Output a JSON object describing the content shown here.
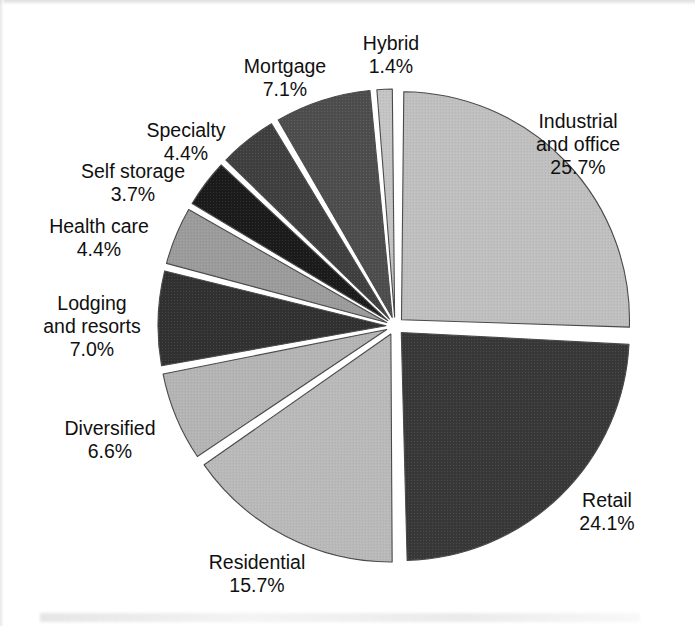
{
  "page": {
    "background_color": "#ffffff",
    "text_color": "#101010"
  },
  "chart_data": {
    "type": "pie",
    "title": "",
    "subtitle": "",
    "xlabel": "",
    "ylabel": "",
    "legend_position": "none",
    "exploded": true,
    "start_angle_deg": 0,
    "direction": "clockwise",
    "units": "percent",
    "total": 100.1,
    "categories": [
      "Industrial and office",
      "Retail",
      "Residential",
      "Diversified",
      "Lodging and resorts",
      "Health care",
      "Self storage",
      "Specialty",
      "Mortgage",
      "Hybrid"
    ],
    "values": [
      25.7,
      24.1,
      15.7,
      6.6,
      7.0,
      4.4,
      3.7,
      4.4,
      7.1,
      1.4
    ],
    "colors": [
      "#bfbfbf",
      "#383838",
      "#b9b9b9",
      "#b4b4b4",
      "#313131",
      "#9b9b9b",
      "#1b1b1b",
      "#3f3f3f",
      "#4d4d4d",
      "#c4c4c4"
    ],
    "slices": [
      {
        "label": "Industrial and office",
        "label_lines": [
          "Industrial",
          "and office"
        ],
        "percent_text": "25.7%",
        "value": 25.7,
        "color": "#bfbfbf",
        "label_x": 578,
        "label_y": 128
      },
      {
        "label": "Retail",
        "label_lines": [
          "Retail"
        ],
        "percent_text": "24.1%",
        "value": 24.1,
        "color": "#383838",
        "label_x": 607,
        "label_y": 507
      },
      {
        "label": "Residential",
        "label_lines": [
          "Residential"
        ],
        "percent_text": "15.7%",
        "value": 15.7,
        "color": "#b9b9b9",
        "label_x": 257,
        "label_y": 569
      },
      {
        "label": "Diversified",
        "label_lines": [
          "Diversified"
        ],
        "percent_text": "6.6%",
        "value": 6.6,
        "color": "#b4b4b4",
        "label_x": 110,
        "label_y": 435
      },
      {
        "label": "Lodging and resorts",
        "label_lines": [
          "Lodging",
          "and resorts"
        ],
        "percent_text": "7.0%",
        "value": 7.0,
        "color": "#313131",
        "label_x": 92,
        "label_y": 310
      },
      {
        "label": "Health care",
        "label_lines": [
          "Health care"
        ],
        "percent_text": "4.4%",
        "value": 4.4,
        "color": "#9b9b9b",
        "label_x": 99,
        "label_y": 233
      },
      {
        "label": "Self storage",
        "label_lines": [
          "Self storage"
        ],
        "percent_text": "3.7%",
        "value": 3.7,
        "color": "#1b1b1b",
        "label_x": 133,
        "label_y": 178
      },
      {
        "label": "Specialty",
        "label_lines": [
          "Specialty"
        ],
        "percent_text": "4.4%",
        "value": 4.4,
        "color": "#3f3f3f",
        "label_x": 186,
        "label_y": 137
      },
      {
        "label": "Mortgage",
        "label_lines": [
          "Mortgage"
        ],
        "percent_text": "7.1%",
        "value": 7.1,
        "color": "#4d4d4d",
        "label_x": 285,
        "label_y": 73
      },
      {
        "label": "Hybrid",
        "label_lines": [
          "Hybrid"
        ],
        "percent_text": "1.4%",
        "value": 1.4,
        "color": "#c4c4c4",
        "label_x": 391,
        "label_y": 50
      }
    ],
    "geometry": {
      "center_x": 395,
      "center_y": 326,
      "radius": 228,
      "explode_offset": 9
    }
  }
}
